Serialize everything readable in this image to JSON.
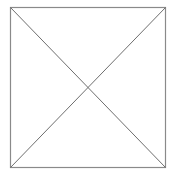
{
  "placeholder": {
    "shape": "square-with-x",
    "icon": "image-placeholder-icon",
    "box": {
      "x": 10,
      "y": 7,
      "width": 155,
      "height": 160
    },
    "colors": {
      "border": "#8a8a8a",
      "diagonal": "#6e6e6e",
      "background": "#ffffff"
    }
  }
}
